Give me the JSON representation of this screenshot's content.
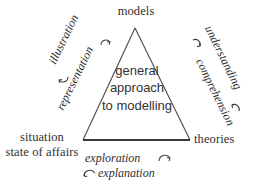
{
  "diagram": {
    "background_color": "#ffffff",
    "stroke_color": "#3a3a3a",
    "text_color": "#2f2f2f"
  },
  "vertices": {
    "top": "models",
    "left_line1": "situation",
    "left_line2": "state of affairs",
    "right": "theories"
  },
  "center": {
    "line1": "general",
    "line2": "approach",
    "line3": "to modelling"
  },
  "edges": {
    "left_upper": "illustration",
    "left_lower": "representation",
    "right_upper": "understanding",
    "right_lower": "comprehension",
    "bottom_upper": "exploration",
    "bottom_lower": "explanation"
  },
  "arrows": {
    "left_upper_icon": "curved-arrow-clockwise-icon",
    "left_lower_icon": "curved-arrow-counterclockwise-icon",
    "right_upper_icon": "curved-arrow-counterclockwise-icon",
    "right_lower_icon": "curved-arrow-clockwise-icon",
    "bottom_upper_icon": "curved-arrow-clockwise-icon",
    "bottom_lower_icon": "curved-arrow-counterclockwise-icon"
  },
  "geometry": {
    "apex_x": 135,
    "apex_y": 28,
    "left_base_x": 83,
    "left_base_y": 140,
    "right_base_x": 190,
    "right_base_y": 140
  }
}
